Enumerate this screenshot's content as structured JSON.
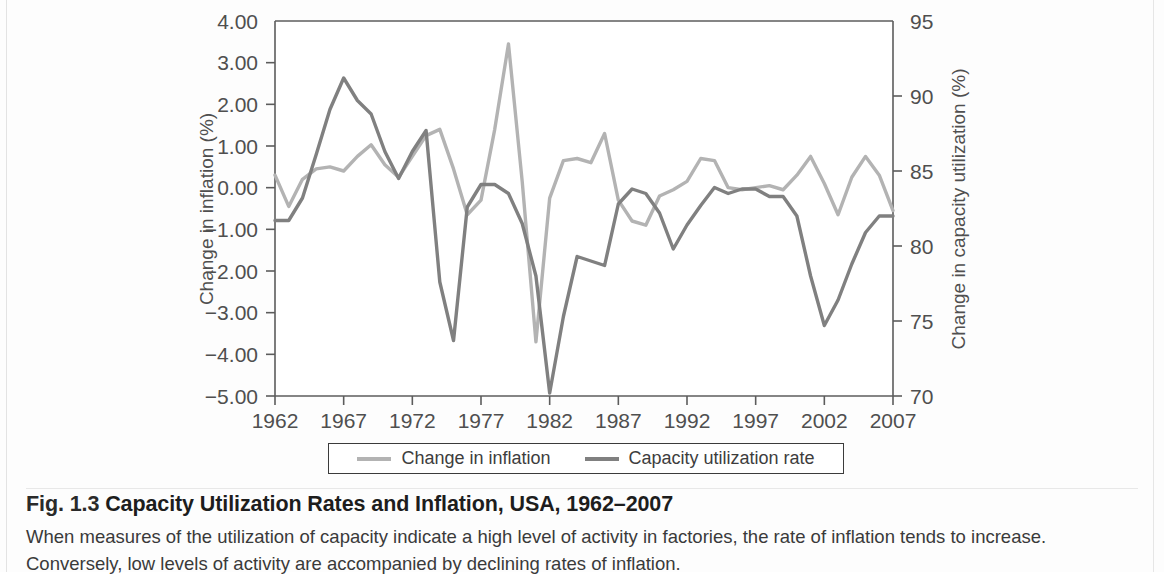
{
  "figure": {
    "caption_number": "Fig. 1.3",
    "caption_title": "Capacity Utilization Rates and Inflation, USA, 1962–2007",
    "caption_body": "When measures of the utilization of capacity indicate a high level of activity in factories, the rate of inflation tends to increase. Conversely, low levels of activity are accompanied by declining rates of inflation."
  },
  "legend": {
    "items": [
      {
        "label": "Change in inflation",
        "color": "#b3b3b3"
      },
      {
        "label": "Capacity utilization rate",
        "color": "#808080"
      }
    ]
  },
  "chart_data": {
    "type": "line",
    "title": "Capacity Utilization Rates and Inflation, USA, 1962–2007",
    "xlabel": "",
    "ylabel": "Change in inflation (%)",
    "y2label": "Change in capacity utilization (%)",
    "grid": false,
    "legend_position": "bottom",
    "xlim": [
      1962,
      2007
    ],
    "ylim": [
      -5,
      4
    ],
    "y2lim": [
      70,
      95
    ],
    "xticks": [
      1962,
      1967,
      1972,
      1977,
      1982,
      1987,
      1992,
      1997,
      2002,
      2007
    ],
    "xtick_labels": [
      "1962",
      "1967",
      "1972",
      "1977",
      "1982",
      "1987",
      "1992",
      "1997",
      "2002",
      "2007"
    ],
    "yticks": [
      -5,
      -4,
      -3,
      -2,
      -1,
      0,
      1,
      2,
      3,
      4
    ],
    "ytick_labels": [
      "−5.00",
      "−4.00",
      "−3.00",
      "−2.00",
      "−1.00",
      "0.00",
      "1.00",
      "2.00",
      "3.00",
      "4.00"
    ],
    "y2ticks": [
      70,
      75,
      80,
      85,
      90,
      95
    ],
    "y2tick_labels": [
      "70",
      "75",
      "80",
      "85",
      "90",
      "95"
    ],
    "x": [
      1962,
      1963,
      1964,
      1965,
      1966,
      1967,
      1968,
      1969,
      1970,
      1971,
      1972,
      1973,
      1974,
      1975,
      1976,
      1977,
      1978,
      1979,
      1980,
      1981,
      1982,
      1983,
      1984,
      1985,
      1986,
      1987,
      1988,
      1989,
      1990,
      1991,
      1992,
      1993,
      1994,
      1995,
      1996,
      1997,
      1998,
      1999,
      2000,
      2001,
      2002,
      2003,
      2004,
      2005,
      2006,
      2007
    ],
    "series": [
      {
        "name": "Change in inflation",
        "axis": "left",
        "color": "#b3b3b3",
        "unit": "%",
        "values": [
          0.3,
          -0.45,
          0.2,
          0.45,
          0.5,
          0.4,
          0.75,
          1.03,
          0.55,
          0.25,
          0.75,
          1.25,
          1.4,
          0.45,
          -0.65,
          -0.3,
          1.4,
          3.45,
          0.15,
          -3.7,
          -0.25,
          0.65,
          0.7,
          0.6,
          1.3,
          -0.3,
          -0.8,
          -0.9,
          -0.2,
          -0.05,
          0.15,
          0.7,
          0.65,
          0.0,
          -0.05,
          0.0,
          0.05,
          -0.05,
          0.3,
          0.75,
          0.1,
          -0.65,
          0.25,
          0.75,
          0.3,
          -0.55
        ]
      },
      {
        "name": "Capacity utilization rate",
        "axis": "right",
        "color": "#808080",
        "unit": "%",
        "values": [
          81.7,
          81.7,
          83.2,
          86.1,
          89.1,
          91.2,
          89.7,
          88.8,
          86.3,
          84.5,
          86.3,
          87.7,
          77.6,
          73.7,
          82.6,
          84.1,
          84.1,
          83.5,
          81.5,
          78.0,
          70.2,
          75.3,
          79.3,
          79.0,
          78.7,
          82.8,
          83.8,
          83.5,
          82.2,
          79.8,
          81.4,
          82.7,
          83.9,
          83.5,
          83.8,
          83.8,
          83.3,
          83.3,
          82.0,
          78.0,
          74.7,
          76.4,
          78.8,
          80.9,
          82.0,
          82.0
        ]
      }
    ]
  },
  "axis_labels": {
    "left_title": "Change in inflation (%)",
    "right_title": "Change in capacity utilization (%)"
  }
}
